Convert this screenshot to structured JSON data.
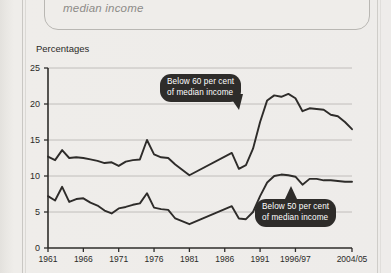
{
  "page": {
    "top_panel_title": "median income"
  },
  "chart_header": {
    "y_axis_title": "Percentages"
  },
  "annotations": [
    {
      "name": "callout-below-60",
      "line1": "Below 60 per cent",
      "line2": "of median income"
    },
    {
      "name": "callout-below-50",
      "line1": "Below 50 per cent",
      "line2": "of median income"
    }
  ],
  "chart_data": {
    "type": "line",
    "title": "",
    "xlabel": "",
    "ylabel": "Percentages",
    "ylim": [
      0,
      25
    ],
    "yticks": [
      0,
      5,
      10,
      15,
      20,
      25
    ],
    "grid": true,
    "legend": "annotated-callouts",
    "x_tick_labels": [
      "1961",
      "1966",
      "1971",
      "1976",
      "1981",
      "1986",
      "1991",
      "1996/97",
      "2004/05"
    ],
    "x_tick_values": [
      1961,
      1966,
      1971,
      1976,
      1981,
      1986,
      1991,
      1996,
      2004
    ],
    "x": [
      1961,
      1962,
      1963,
      1964,
      1965,
      1966,
      1967,
      1968,
      1969,
      1970,
      1971,
      1972,
      1973,
      1974,
      1975,
      1976,
      1977,
      1978,
      1979,
      1981,
      1987,
      1988,
      1989,
      1990,
      1991,
      1992,
      1993,
      1994,
      1995,
      1996,
      1997,
      1998,
      1999,
      2000,
      2001,
      2002,
      2003,
      2004
    ],
    "series": [
      {
        "name": "Below 60 per cent of median income",
        "color": "#2e2c2a",
        "values": [
          12.7,
          12.2,
          13.6,
          12.5,
          12.6,
          12.5,
          12.3,
          12.1,
          11.8,
          11.9,
          11.4,
          12.0,
          12.2,
          12.3,
          15.0,
          13.0,
          12.6,
          12.5,
          11.6,
          10.1,
          13.2,
          11.0,
          11.5,
          13.8,
          17.5,
          20.5,
          21.2,
          21.0,
          21.4,
          20.8,
          19.0,
          19.4,
          19.3,
          19.2,
          18.5,
          18.3,
          17.5,
          16.5
        ]
      },
      {
        "name": "Below 50 per cent of median income",
        "color": "#2e2c2a",
        "values": [
          7.2,
          6.6,
          8.5,
          6.4,
          6.8,
          6.9,
          6.3,
          5.9,
          5.2,
          4.8,
          5.5,
          5.7,
          6.0,
          6.2,
          7.6,
          5.6,
          5.4,
          5.3,
          4.1,
          3.3,
          5.8,
          4.1,
          4.0,
          5.0,
          7.2,
          9.1,
          10.0,
          10.2,
          10.1,
          9.9,
          8.8,
          9.6,
          9.6,
          9.4,
          9.4,
          9.3,
          9.2,
          9.2
        ]
      }
    ]
  }
}
